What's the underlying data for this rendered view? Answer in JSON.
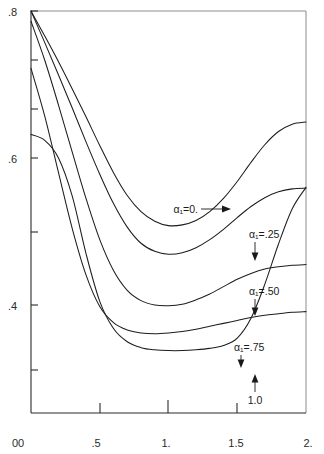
{
  "chart_data": {
    "type": "line",
    "title": "",
    "xlabel": "",
    "ylabel": "",
    "xlim": [
      0,
      2.0
    ],
    "ylim": [
      0.28,
      0.8
    ],
    "grid": false,
    "legend_position": "inline-annotations",
    "x_ticks": [
      {
        "value": 0,
        "label": "0"
      },
      {
        "value": 0.5,
        "label": ".5"
      },
      {
        "value": 1.0,
        "label": "1."
      },
      {
        "value": 1.5,
        "label": "1.5"
      },
      {
        "value": 2.0,
        "label": "2."
      }
    ],
    "y_ticks": [
      {
        "value": 0.8,
        "label": ".8"
      },
      {
        "value": 0.75,
        "label": ""
      },
      {
        "value": 0.7,
        "label": ""
      },
      {
        "value": 0.6,
        "label": ".6"
      },
      {
        "value": 0.5,
        "label": ""
      },
      {
        "value": 0.4,
        "label": ".4"
      },
      {
        "value": 0.32,
        "label": ""
      },
      {
        "value": 0.0,
        "label": "0"
      }
    ],
    "y_axis_break": true,
    "series": [
      {
        "name": "alpha_1 = 0.",
        "label": "α₁=0.",
        "label_arrow": "right",
        "x": [
          0.0,
          0.1,
          0.2,
          0.3,
          0.4,
          0.5,
          0.6,
          0.7,
          0.8,
          0.9,
          1.0,
          1.1,
          1.2,
          1.3,
          1.4,
          1.5,
          1.6,
          1.7,
          1.8,
          1.9,
          2.0
        ],
        "y": [
          0.8,
          0.766,
          0.731,
          0.694,
          0.656,
          0.617,
          0.58,
          0.549,
          0.527,
          0.514,
          0.508,
          0.509,
          0.515,
          0.527,
          0.545,
          0.568,
          0.594,
          0.618,
          0.636,
          0.646,
          0.649
        ]
      },
      {
        "name": "alpha_1 = .25",
        "label": "α₁=.25",
        "label_arrow": "down",
        "x": [
          0.0,
          0.1,
          0.2,
          0.3,
          0.4,
          0.5,
          0.6,
          0.7,
          0.8,
          0.9,
          1.0,
          1.1,
          1.2,
          1.3,
          1.4,
          1.5,
          1.6,
          1.7,
          1.8,
          1.9,
          2.0
        ],
        "y": [
          0.8,
          0.757,
          0.713,
          0.668,
          0.622,
          0.578,
          0.538,
          0.506,
          0.484,
          0.473,
          0.469,
          0.471,
          0.478,
          0.489,
          0.503,
          0.519,
          0.534,
          0.546,
          0.554,
          0.558,
          0.559
        ]
      },
      {
        "name": "alpha_1 = .50",
        "label": "α₁=.50",
        "label_arrow": "down",
        "x": [
          0.0,
          0.1,
          0.2,
          0.3,
          0.4,
          0.5,
          0.6,
          0.7,
          0.8,
          0.9,
          1.0,
          1.1,
          1.2,
          1.3,
          1.4,
          1.5,
          1.6,
          1.7,
          1.8,
          1.9,
          2.0
        ],
        "y": [
          0.786,
          0.733,
          0.672,
          0.608,
          0.545,
          0.489,
          0.447,
          0.42,
          0.406,
          0.4,
          0.399,
          0.401,
          0.407,
          0.415,
          0.425,
          0.435,
          0.443,
          0.449,
          0.452,
          0.454,
          0.455
        ]
      },
      {
        "name": "alpha_1 = .75",
        "label": "α₁=.75",
        "label_arrow": "down",
        "x": [
          0.0,
          0.1,
          0.2,
          0.3,
          0.4,
          0.5,
          0.6,
          0.7,
          0.8,
          0.9,
          1.0,
          1.1,
          1.2,
          1.3,
          1.4,
          1.5,
          1.6,
          1.7,
          1.8,
          1.9,
          2.0
        ],
        "y": [
          0.722,
          0.657,
          0.58,
          0.504,
          0.441,
          0.398,
          0.376,
          0.366,
          0.362,
          0.361,
          0.362,
          0.364,
          0.367,
          0.371,
          0.375,
          0.379,
          0.383,
          0.386,
          0.388,
          0.39,
          0.391
        ]
      },
      {
        "name": "alpha_1 = 1.0",
        "label": "1.0",
        "label_arrow": "up",
        "x": [
          0.0,
          0.1,
          0.2,
          0.3,
          0.4,
          0.5,
          0.6,
          0.7,
          0.8,
          0.9,
          1.0,
          1.1,
          1.2,
          1.3,
          1.4,
          1.5,
          1.6,
          1.7,
          1.8,
          1.9,
          2.0
        ],
        "y": [
          0.632,
          0.624,
          0.6,
          0.548,
          0.47,
          0.405,
          0.368,
          0.35,
          0.342,
          0.339,
          0.338,
          0.338,
          0.339,
          0.341,
          0.345,
          0.355,
          0.382,
          0.428,
          0.483,
          0.531,
          0.56
        ]
      }
    ],
    "annotations": [
      {
        "text": "α₁=0.",
        "x_px": 198,
        "y_px": 210,
        "arrow": "right"
      },
      {
        "text": "α₁=.25",
        "x_px": 246,
        "y_px": 238,
        "arrow": "down"
      },
      {
        "text": "α₁=.50",
        "x_px": 246,
        "y_px": 295,
        "arrow": "down"
      },
      {
        "text": "α₁=.75",
        "x_px": 232,
        "y_px": 350,
        "arrow": "down"
      },
      {
        "text": "1.0",
        "x_px": 255,
        "y_px": 400,
        "arrow": "up"
      }
    ]
  }
}
